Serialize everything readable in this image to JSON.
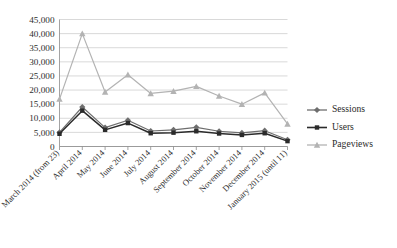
{
  "chart_data": {
    "type": "line",
    "title": "",
    "subtitle": "",
    "xlabel": "",
    "ylabel": "",
    "ylim": [
      0,
      45000
    ],
    "ytick_step": 5000,
    "grid": true,
    "legend_position": "right",
    "categories": [
      "March 2014 (from 23)",
      "April 2014",
      "May 2014",
      "June 2014",
      "July 2014",
      "August 2014",
      "September 2014",
      "October 2014",
      "November 2014",
      "December 2014",
      "January 2015 (until 11)"
    ],
    "ytick_labels": [
      "0",
      "5,000",
      "10,000",
      "15,000",
      "20,000",
      "25,000",
      "30,000",
      "35,000",
      "40,000",
      "45,000"
    ],
    "series": [
      {
        "name": "Sessions",
        "marker": "diamond",
        "color": "#6e6e6e",
        "values": [
          5000,
          14000,
          6700,
          9300,
          5500,
          5900,
          6800,
          5400,
          4800,
          5600,
          2400
        ]
      },
      {
        "name": "Users",
        "marker": "square",
        "color": "#2b2b2b",
        "values": [
          4500,
          12700,
          5900,
          8300,
          4700,
          4900,
          5400,
          4600,
          4100,
          4700,
          1900
        ]
      },
      {
        "name": "Pageviews",
        "marker": "triangle",
        "color": "#b3b3b3",
        "values": [
          16800,
          40000,
          19300,
          25400,
          18800,
          19600,
          21300,
          17900,
          15000,
          19000,
          8000
        ]
      }
    ]
  },
  "legend": {
    "items": [
      {
        "label": "Sessions"
      },
      {
        "label": "Users"
      },
      {
        "label": "Pageviews"
      }
    ]
  },
  "colors": {
    "sessions": "#6e6e6e",
    "users": "#2b2b2b",
    "pageviews": "#b3b3b3",
    "grid": "#c9c9c9",
    "axis": "#8c8c8c",
    "text": "#2e2e2e",
    "background": "#ffffff"
  }
}
